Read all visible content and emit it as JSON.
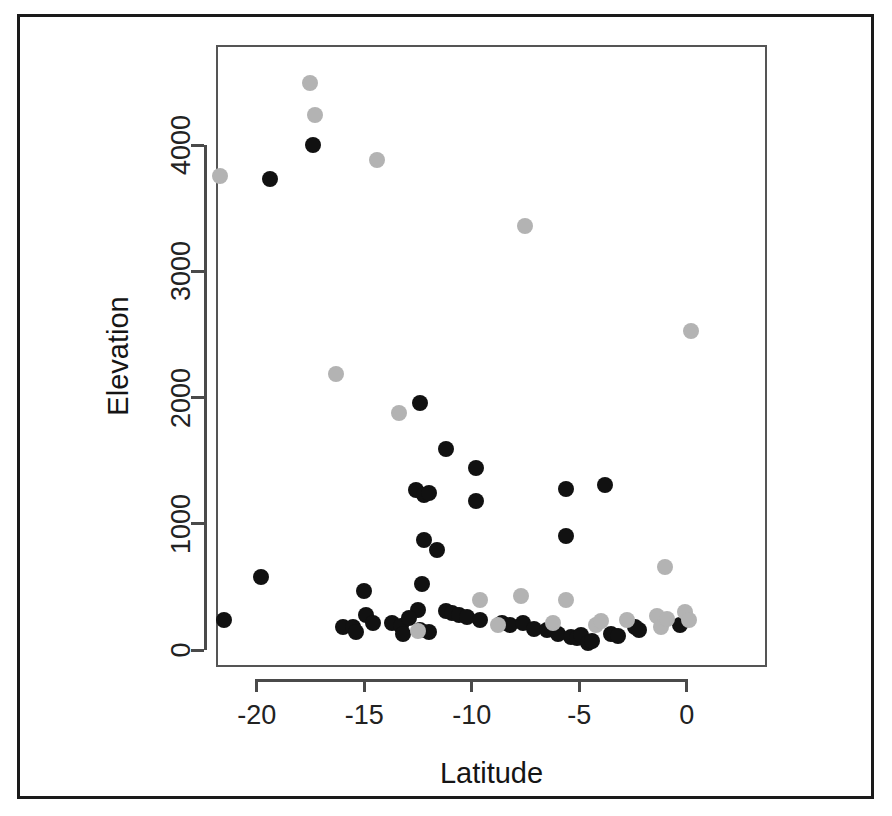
{
  "figure": {
    "background_color": "#ffffff",
    "frame_color": "#1a1a1a",
    "panel_border_color": "#555555"
  },
  "chart_data": {
    "type": "scatter",
    "title": "",
    "xlabel": "Latitude",
    "ylabel": "Elevation",
    "xlim": [
      -21.9,
      0.6
    ],
    "ylim": [
      -200,
      4650
    ],
    "xticks": [
      -20,
      -15,
      -10,
      -5,
      0
    ],
    "xticklabels": [
      "-20",
      "-15",
      "-10",
      "-5",
      "0"
    ],
    "yticks": [
      0,
      1000,
      2000,
      3000,
      4000
    ],
    "yticklabels": [
      "0",
      "1000",
      "2000",
      "3000",
      "4000"
    ],
    "grid": false,
    "legend": "none",
    "marker": "filled-circle",
    "marker_size_px": 16,
    "series": [
      {
        "name": "black-group",
        "color": "#111111",
        "points": [
          [
            -19.4,
            3730
          ],
          [
            -17.4,
            4000
          ],
          [
            -19.8,
            575
          ],
          [
            -21.5,
            240
          ],
          [
            -16.0,
            180
          ],
          [
            -15.0,
            470
          ],
          [
            -15.5,
            185
          ],
          [
            -15.4,
            140
          ],
          [
            -14.9,
            275
          ],
          [
            -14.6,
            215
          ],
          [
            -13.7,
            215
          ],
          [
            -13.3,
            190
          ],
          [
            -13.2,
            125
          ],
          [
            -12.4,
            1960
          ],
          [
            -12.6,
            1265
          ],
          [
            -12.2,
            1230
          ],
          [
            -12.0,
            1240
          ],
          [
            -12.2,
            870
          ],
          [
            -11.6,
            790
          ],
          [
            -12.3,
            520
          ],
          [
            -12.5,
            320
          ],
          [
            -12.9,
            250
          ],
          [
            -12.4,
            155
          ],
          [
            -12.0,
            140
          ],
          [
            -11.2,
            1590
          ],
          [
            -11.2,
            310
          ],
          [
            -10.9,
            290
          ],
          [
            -10.6,
            275
          ],
          [
            -9.8,
            1440
          ],
          [
            -9.8,
            1180
          ],
          [
            -10.2,
            260
          ],
          [
            -9.6,
            240
          ],
          [
            -8.6,
            215
          ],
          [
            -8.2,
            195
          ],
          [
            -7.6,
            215
          ],
          [
            -7.1,
            165
          ],
          [
            -6.5,
            160
          ],
          [
            -6.0,
            130
          ],
          [
            -5.6,
            900
          ],
          [
            -5.6,
            1275
          ],
          [
            -5.4,
            105
          ],
          [
            -5.1,
            95
          ],
          [
            -4.9,
            115
          ],
          [
            -4.6,
            55
          ],
          [
            -4.4,
            70
          ],
          [
            -3.8,
            1310
          ],
          [
            -3.5,
            125
          ],
          [
            -3.2,
            110
          ],
          [
            -2.4,
            180
          ],
          [
            -2.2,
            155
          ],
          [
            -0.3,
            195
          ]
        ]
      },
      {
        "name": "gray-group",
        "color": "#b3b3b3",
        "points": [
          [
            -17.5,
            4490
          ],
          [
            -17.3,
            4240
          ],
          [
            -21.7,
            3755
          ],
          [
            -14.4,
            3880
          ],
          [
            -7.5,
            3355
          ],
          [
            0.2,
            2525
          ],
          [
            -16.3,
            2185
          ],
          [
            -13.4,
            1875
          ],
          [
            -1.0,
            655
          ],
          [
            -9.6,
            400
          ],
          [
            -7.7,
            430
          ],
          [
            -12.5,
            150
          ],
          [
            -8.8,
            195
          ],
          [
            -6.2,
            210
          ],
          [
            -5.6,
            400
          ],
          [
            -4.2,
            195
          ],
          [
            -4.0,
            230
          ],
          [
            -2.8,
            240
          ],
          [
            -1.4,
            270
          ],
          [
            -1.2,
            185
          ],
          [
            -0.1,
            300
          ],
          [
            0.1,
            235
          ],
          [
            -0.9,
            245
          ]
        ]
      }
    ]
  }
}
